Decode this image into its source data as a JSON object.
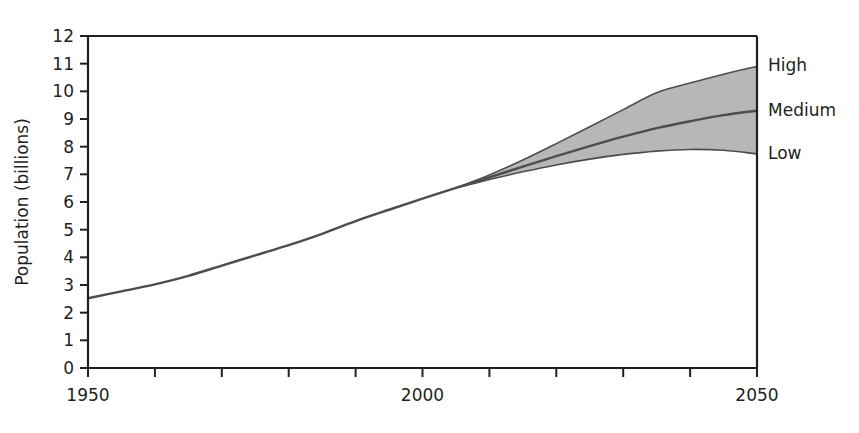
{
  "chart_data": {
    "type": "line",
    "title": "",
    "subtitle": "",
    "xlabel": "",
    "ylabel": "Population (billions)",
    "xlim": [
      1950,
      2050
    ],
    "ylim": [
      0,
      12
    ],
    "grid": false,
    "legend_position": "right-outside-endpoint",
    "band": {
      "name": "Projection range (Low to High)",
      "fill_color": "#b3b3b3",
      "lower_series": "Low",
      "upper_series": "High"
    },
    "x_ticks": [
      1950,
      1960,
      1970,
      1980,
      1990,
      2000,
      2010,
      2020,
      2030,
      2040,
      2050
    ],
    "x_tick_labels": [
      "1950",
      "",
      "",
      "",
      "",
      "2000",
      "",
      "",
      "",
      "",
      "2050"
    ],
    "y_ticks": [
      0,
      1,
      2,
      3,
      4,
      5,
      6,
      7,
      8,
      9,
      10,
      11,
      12
    ],
    "y_tick_labels": [
      "0",
      "1",
      "2",
      "3",
      "4",
      "5",
      "6",
      "7",
      "8",
      "9",
      "10",
      "11",
      "12"
    ],
    "x": [
      1950,
      1955,
      1960,
      1965,
      1970,
      1975,
      1980,
      1985,
      1990,
      1995,
      2000,
      2005,
      2010,
      2015,
      2020,
      2025,
      2030,
      2035,
      2040,
      2045,
      2050
    ],
    "series": [
      {
        "name": "Historical",
        "color": "#4d4d4d",
        "values": [
          2.52,
          2.77,
          3.02,
          3.33,
          3.7,
          4.07,
          4.44,
          4.85,
          5.31,
          5.72,
          6.12,
          6.51,
          null,
          null,
          null,
          null,
          null,
          null,
          null,
          null,
          null
        ]
      },
      {
        "name": "High",
        "color": "#4d4d4d",
        "values": [
          null,
          null,
          null,
          null,
          null,
          null,
          null,
          null,
          null,
          null,
          null,
          6.51,
          6.98,
          7.52,
          8.11,
          8.72,
          9.34,
          9.95,
          10.3,
          10.62,
          10.9
        ]
      },
      {
        "name": "Medium",
        "color": "#4d4d4d",
        "values": [
          null,
          null,
          null,
          null,
          null,
          null,
          null,
          null,
          null,
          null,
          null,
          6.51,
          6.89,
          7.28,
          7.66,
          8.02,
          8.36,
          8.67,
          8.92,
          9.14,
          9.3
        ]
      },
      {
        "name": "Low",
        "color": "#4d4d4d",
        "values": [
          null,
          null,
          null,
          null,
          null,
          null,
          null,
          null,
          null,
          null,
          null,
          6.51,
          6.81,
          7.09,
          7.34,
          7.55,
          7.72,
          7.84,
          7.9,
          7.87,
          7.74
        ]
      }
    ],
    "series_labels": [
      {
        "text": "High",
        "value": 10.9,
        "year": 2050
      },
      {
        "text": "Medium",
        "value": 9.3,
        "year": 2050
      },
      {
        "text": "Low",
        "value": 7.74,
        "year": 2050
      }
    ],
    "annotations": []
  },
  "colors": {
    "axis": "#231f20",
    "line": "#4d4d4d",
    "band_fill": "#b3b3b3",
    "background": "#ffffff",
    "text": "#231f20"
  }
}
